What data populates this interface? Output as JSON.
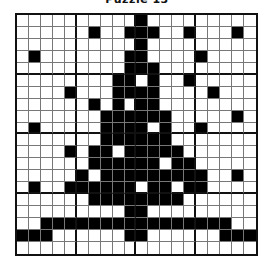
{
  "title": "Puzzle 13",
  "grid": {
    "rows": 20,
    "cols": 20,
    "block_size": 5,
    "fill_color": "#000000",
    "empty_color": "#ffffff",
    "filled": [
      [
        10
      ],
      [
        6,
        9,
        10,
        11,
        14,
        18
      ],
      [
        10
      ],
      [
        1,
        9,
        10,
        15
      ],
      [
        9,
        10,
        11
      ],
      [
        8,
        9,
        11,
        14
      ],
      [
        4,
        8,
        9,
        10,
        11,
        16
      ],
      [
        6,
        8,
        10,
        11
      ],
      [
        7,
        8,
        9,
        10,
        11,
        12,
        18
      ],
      [
        1,
        7,
        8,
        9,
        10,
        12,
        15
      ],
      [
        7,
        8,
        9,
        10,
        11,
        12
      ],
      [
        4,
        6,
        7,
        9,
        10,
        11,
        12,
        13
      ],
      [
        6,
        7,
        8,
        9,
        10,
        11,
        13,
        14
      ],
      [
        5,
        7,
        8,
        9,
        10,
        11,
        12,
        13,
        14,
        15,
        18
      ],
      [
        1,
        4,
        5,
        6,
        7,
        8,
        9,
        11,
        12,
        14,
        15
      ],
      [
        6,
        7,
        8,
        9,
        10,
        11,
        12,
        13
      ],
      [
        9,
        10
      ],
      [
        2,
        3,
        4,
        5,
        6,
        7,
        8,
        9,
        10,
        11,
        12,
        13,
        14,
        15,
        16,
        17
      ],
      [
        0,
        1,
        2,
        9,
        10,
        17,
        18,
        19
      ],
      []
    ]
  }
}
